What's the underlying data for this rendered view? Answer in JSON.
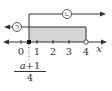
{
  "diagram": {
    "type": "number-line-inequality",
    "axis_label": "x",
    "ticks": [
      {
        "value": "0",
        "x": 21
      },
      {
        "value": "1",
        "x": 37
      },
      {
        "value": "2",
        "x": 53
      },
      {
        "value": "3",
        "x": 69
      },
      {
        "value": "4",
        "x": 86
      }
    ],
    "closed_point": {
      "label": "(a+1)/4",
      "x": 29
    },
    "open_point": {
      "value": "4",
      "x": 86
    },
    "fraction": {
      "numerator_var": "a",
      "numerator_rest": "+1",
      "denominator": "4"
    },
    "regions": {
      "left_arrow_label": "ㄱ",
      "right_arrow_label": "ㄴ"
    },
    "colors": {
      "line": "#333333",
      "shade": "#d6d6d6"
    }
  }
}
